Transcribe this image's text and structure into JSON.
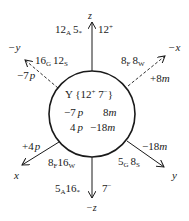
{
  "diagram": {
    "type": "newman-style coordinate / axis diagram",
    "center_label": {
      "species": "Y",
      "charges": "{12",
      "charge1_sup": "+",
      "charge2": " 7",
      "charge2_sup": "−",
      "close": "}"
    },
    "center_rows": [
      {
        "left_num": "−7",
        "left_unit": "p",
        "right_num": "8",
        "right_unit": "m"
      },
      {
        "left_num": "4",
        "left_unit": "p",
        "right_num": "−18",
        "right_unit": "m"
      }
    ],
    "axes": {
      "plus_z": {
        "label": "z",
        "left_a": "12",
        "left_a_sub": "A",
        "left_b": "5",
        "left_b_sub": "*",
        "right": "12",
        "right_sup": "+"
      },
      "minus_z": {
        "label": "−z",
        "left_a": "5",
        "left_a_sub": "A",
        "left_b": "16",
        "left_b_sub": "*",
        "right": "7",
        "right_sup": "−"
      },
      "minus_y": {
        "label": "−y",
        "inner_a": "16",
        "inner_a_sub": "G",
        "inner_b": "12",
        "inner_b_sub": "S",
        "outer_num": "−7",
        "outer_unit": "p",
        "style": "dashed"
      },
      "minus_x": {
        "label": "−x",
        "inner_a": "8",
        "inner_a_sub": "F",
        "inner_b": "8",
        "inner_b_sub": "W",
        "outer_num": "+8",
        "outer_unit": "m",
        "style": "dashed"
      },
      "plus_x": {
        "label": "x",
        "inner_a": "8",
        "inner_a_sub": "F",
        "inner_b": "16",
        "inner_b_sub": "W",
        "outer_num": "+4",
        "outer_unit": "p",
        "style": "solid"
      },
      "plus_y": {
        "label": "y",
        "inner_a": "5",
        "inner_a_sub": "G",
        "inner_b": "8",
        "inner_b_sub": "S",
        "outer_num": "−18",
        "outer_unit": "m",
        "style": "solid"
      }
    },
    "colors": {
      "line": "#1a1a1a",
      "background": "#ffffff"
    }
  }
}
